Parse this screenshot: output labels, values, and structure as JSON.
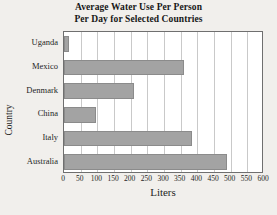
{
  "chart_data": {
    "type": "bar",
    "orientation": "horizontal",
    "title": "Average Water Use Per Person Per Day for Selected Countries",
    "title_lines": [
      "Average Water Use Per Person",
      "Per Day for Selected Countries"
    ],
    "categories": [
      "Uganda",
      "Mexico",
      "Denmark",
      "China",
      "Italy",
      "Australia"
    ],
    "values": [
      15,
      360,
      210,
      95,
      385,
      490
    ],
    "xlabel": "Liters",
    "ylabel": "Country",
    "xlim": [
      0,
      600
    ],
    "xticks": [
      0,
      50,
      100,
      150,
      200,
      250,
      300,
      350,
      400,
      450,
      500,
      550,
      600
    ],
    "xtick_labels": [
      "0",
      "50",
      "100",
      "150",
      "200",
      "250",
      "300",
      "350",
      "400",
      "450",
      "500",
      "550",
      "600"
    ],
    "grid": true,
    "grid_axis": "x",
    "legend": null,
    "bar_color": "#a3a3a3",
    "bar_edge_color": "#8b8b8b",
    "plot_background": "#ffffff",
    "page_background": "#f1efec",
    "frame_color": "#6f6f6f",
    "gridline_color": "#c9c9c9",
    "text_color": "#1f1f1f"
  }
}
